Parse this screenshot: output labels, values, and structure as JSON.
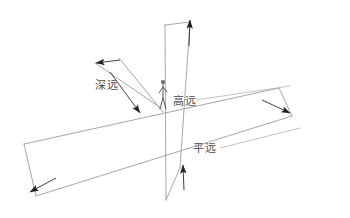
{
  "diagram": {
    "background_color": "#ffffff",
    "line_color": "#8a8a8a",
    "arrow_color": "#1f1f1f",
    "text_color": "#4a4a4a",
    "style": "hand-drawn pencil sketch",
    "axes": [
      {
        "id": "shenyuan",
        "label": "深远",
        "meaning": "deep distance",
        "direction": "diagonal upper-left to lower-right",
        "arrowheads": 2
      },
      {
        "id": "gaoyuan",
        "label": "高远",
        "meaning": "high distance",
        "direction": "vertical",
        "arrowheads": 2
      },
      {
        "id": "pingyuan",
        "label": "平远",
        "meaning": "level distance",
        "direction": "horizontal plane",
        "arrowheads": 2
      }
    ],
    "figure": {
      "name": "standing-person",
      "position": "origin"
    }
  }
}
